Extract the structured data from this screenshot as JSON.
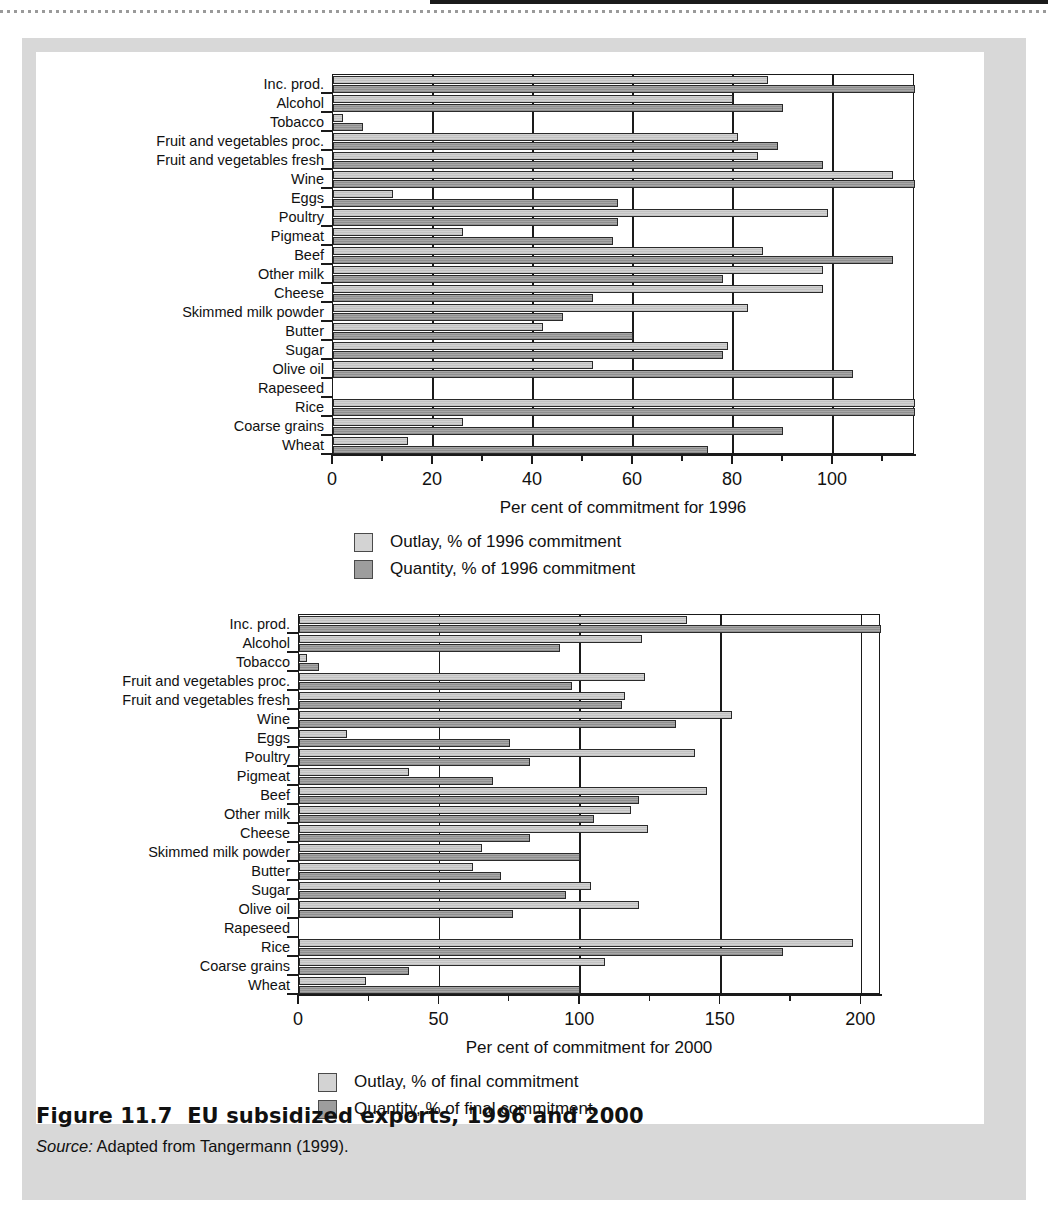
{
  "figure": {
    "title": "Figure 11.7  EU subsidized exports, 1996 and 2000",
    "source_label": "Source:",
    "source_text": " Adapted from Tangermann (1999)."
  },
  "colors": {
    "outlay": "#d3d3d3",
    "quantity": "#9d9d9d",
    "axis": "#1a1a1a",
    "panel": "#d8d8d8",
    "page": "#ffffff"
  },
  "chart_data": [
    {
      "id": "chart-1996",
      "type": "bar",
      "orientation": "horizontal",
      "title": "",
      "xlabel": "Per cent of commitment for 1996",
      "ylabel": "",
      "xlim": [
        0,
        116.4
      ],
      "xticks": [
        0,
        20,
        40,
        60,
        80,
        100
      ],
      "xtick_labels": [
        "0",
        "20",
        "40",
        "60",
        "80",
        "100"
      ],
      "xminor_ticks": [
        10,
        30,
        50,
        70,
        90,
        110
      ],
      "grid": "vertical",
      "legend_position": "below",
      "categories": [
        "Inc. prod.",
        "Alcohol",
        "Tobacco",
        "Fruit and vegetables proc.",
        "Fruit and vegetables fresh",
        "Wine",
        "Eggs",
        "Poultry",
        "Pigmeat",
        "Beef",
        "Other milk",
        "Cheese",
        "Skimmed milk powder",
        "Butter",
        "Sugar",
        "Olive oil",
        "Rapeseed",
        "Rice",
        "Coarse grains",
        "Wheat"
      ],
      "series": [
        {
          "name": "Outlay, % of 1996 commitment",
          "key": "outlay",
          "values": [
            87,
            80,
            2,
            81,
            85,
            112,
            12,
            99,
            26,
            86,
            98,
            98,
            83,
            42,
            79,
            52,
            0,
            116.4,
            26,
            15
          ]
        },
        {
          "name": "Quantity, % of 1996 commitment",
          "key": "quantity",
          "values": [
            116.4,
            90,
            6,
            89,
            98,
            116.4,
            57,
            57,
            56,
            112,
            78,
            52,
            46,
            60,
            78,
            104,
            0,
            116.4,
            90,
            75
          ]
        }
      ],
      "legend": [
        {
          "swatch": "outlay",
          "label": "Outlay, % of 1996 commitment"
        },
        {
          "swatch": "quantity",
          "label": "Quantity, % of 1996 commitment"
        }
      ]
    },
    {
      "id": "chart-2000",
      "type": "bar",
      "orientation": "horizontal",
      "title": "",
      "xlabel": "Per cent of commitment for 2000",
      "ylabel": "",
      "xlim": [
        0,
        207
      ],
      "xticks": [
        0,
        50,
        100,
        150,
        200
      ],
      "xtick_labels": [
        "0",
        "50",
        "100",
        "150",
        "200"
      ],
      "xminor_ticks": [
        25,
        75,
        125,
        175
      ],
      "grid": "vertical",
      "legend_position": "below",
      "categories": [
        "Inc. prod.",
        "Alcohol",
        "Tobacco",
        "Fruit and vegetables proc.",
        "Fruit and vegetables fresh",
        "Wine",
        "Eggs",
        "Poultry",
        "Pigmeat",
        "Beef",
        "Other milk",
        "Cheese",
        "Skimmed milk powder",
        "Butter",
        "Sugar",
        "Olive oil",
        "Rapeseed",
        "Rice",
        "Coarse grains",
        "Wheat"
      ],
      "series": [
        {
          "name": "Outlay, % of final commitment",
          "key": "outlay",
          "values": [
            138,
            122,
            3,
            123,
            116,
            154,
            17,
            141,
            39,
            145,
            118,
            124,
            65,
            62,
            104,
            121,
            0,
            197,
            109,
            24
          ]
        },
        {
          "name": "Quantity, % of final commitment",
          "key": "quantity",
          "values": [
            207,
            93,
            7,
            97,
            115,
            134,
            75,
            82,
            69,
            121,
            105,
            82,
            100,
            72,
            95,
            76,
            0,
            172,
            39,
            100
          ]
        }
      ],
      "legend": [
        {
          "swatch": "outlay",
          "label": "Outlay, % of final commitment"
        },
        {
          "swatch": "quantity",
          "label": "Quantity, % of final commitment"
        }
      ]
    }
  ]
}
